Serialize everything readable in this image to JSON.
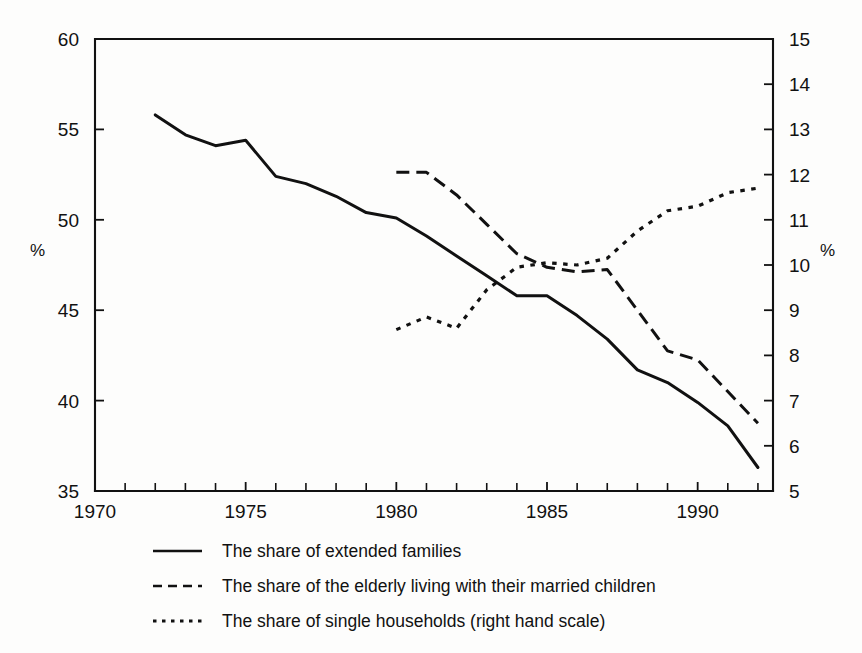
{
  "chart_data": {
    "type": "line",
    "title": "",
    "subtitle": "",
    "xlabel": "",
    "ylabel": "%",
    "ylabel_right": "%",
    "xlim": [
      1970,
      1992.5
    ],
    "ylim": [
      35,
      60
    ],
    "ylim_right": [
      5,
      15
    ],
    "grid": false,
    "legend_position": "below-center",
    "x_ticks": [
      1970,
      1975,
      1980,
      1985,
      1990
    ],
    "x_tick_labels": [
      "1970",
      "1975",
      "1980",
      "1985",
      "1990"
    ],
    "x_minor_ticks": [
      1971,
      1972,
      1973,
      1974,
      1976,
      1977,
      1978,
      1979,
      1981,
      1982,
      1983,
      1984,
      1986,
      1987,
      1988,
      1989,
      1991,
      1992
    ],
    "y_ticks_left": [
      35,
      40,
      45,
      50,
      55,
      60
    ],
    "y_tick_labels_left": [
      "35",
      "40",
      "45",
      "50",
      "55",
      "60"
    ],
    "y_ticks_right": [
      5,
      6,
      7,
      8,
      9,
      10,
      11,
      12,
      13,
      14,
      15
    ],
    "y_tick_labels_right": [
      "5",
      "6",
      "7",
      "8",
      "9",
      "10",
      "11",
      "12",
      "13",
      "14",
      "15"
    ],
    "series": [
      {
        "name": "The share of extended families",
        "style": "solid",
        "axis": "left",
        "x": [
          1972,
          1973,
          1974,
          1975,
          1976,
          1977,
          1978,
          1979,
          1980,
          1981,
          1982,
          1983,
          1984,
          1985,
          1986,
          1987,
          1988,
          1989,
          1990,
          1991,
          1992
        ],
        "values": [
          55.8,
          54.7,
          54.1,
          54.4,
          52.4,
          52.0,
          51.3,
          50.4,
          50.1,
          49.1,
          48.0,
          46.9,
          45.8,
          45.8,
          44.7,
          43.4,
          41.7,
          41.0,
          39.9,
          38.6,
          36.3
        ]
      },
      {
        "name": "The share of the elderly living with their married children",
        "style": "dashed",
        "axis": "right",
        "x": [
          1980,
          1981,
          1982,
          1983,
          1984,
          1985,
          1986,
          1987,
          1988,
          1989,
          1990,
          1991,
          1992
        ],
        "values": [
          12.05,
          12.05,
          11.55,
          10.9,
          10.25,
          9.95,
          9.85,
          9.9,
          9.0,
          8.1,
          7.9,
          7.2,
          6.5
        ]
      },
      {
        "name": "The share of single households (right hand scale)",
        "style": "dotted",
        "axis": "right",
        "x": [
          1980,
          1981,
          1982,
          1983,
          1984,
          1985,
          1986,
          1987,
          1988,
          1989,
          1990,
          1991,
          1992
        ],
        "values": [
          8.57,
          8.85,
          8.6,
          9.45,
          9.95,
          10.05,
          10.0,
          10.15,
          10.75,
          11.2,
          11.3,
          11.6,
          11.7
        ]
      }
    ]
  },
  "legend": {
    "items": [
      {
        "label": "The share of extended families",
        "style": "solid"
      },
      {
        "label": "The share of the elderly living with their married children",
        "style": "dashed"
      },
      {
        "label": "The share of single households (right hand scale)",
        "style": "dotted"
      }
    ]
  },
  "axes": {
    "left_unit": "%",
    "right_unit": "%"
  }
}
